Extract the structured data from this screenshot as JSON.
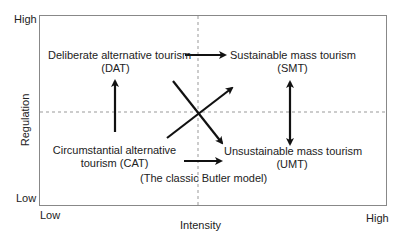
{
  "diagram": {
    "axes": {
      "y_label": "Regulation",
      "x_label": "Intensity",
      "y_high": "High",
      "y_low": "Low",
      "x_low": "Low",
      "x_high": "High"
    },
    "quadrants": {
      "dat": {
        "line1": "Deliberate alternative tourism",
        "line2": "(DAT)"
      },
      "smt": {
        "line1": "Sustainable mass tourism",
        "line2": "(SMT)"
      },
      "cat": {
        "line1": "Circumstantial alternative",
        "line2": "tourism (CAT)"
      },
      "umt": {
        "line1": "Unsustainable mass tourism",
        "line2": "(UMT)"
      }
    },
    "annotation": "(The classic Butler model)",
    "arrows": [
      {
        "from": "CAT",
        "to": "DAT",
        "type": "single"
      },
      {
        "from": "DAT",
        "to": "SMT",
        "type": "single"
      },
      {
        "from": "CAT",
        "to": "SMT",
        "type": "single"
      },
      {
        "from": "DAT",
        "to": "UMT",
        "type": "single"
      },
      {
        "from": "CAT",
        "to": "UMT",
        "type": "single",
        "label": "(The classic Butler model)"
      },
      {
        "from": "SMT",
        "to": "UMT",
        "type": "double"
      }
    ],
    "colors": {
      "frame": "#888888",
      "arrow": "#111111",
      "dashed": "#999999"
    }
  }
}
